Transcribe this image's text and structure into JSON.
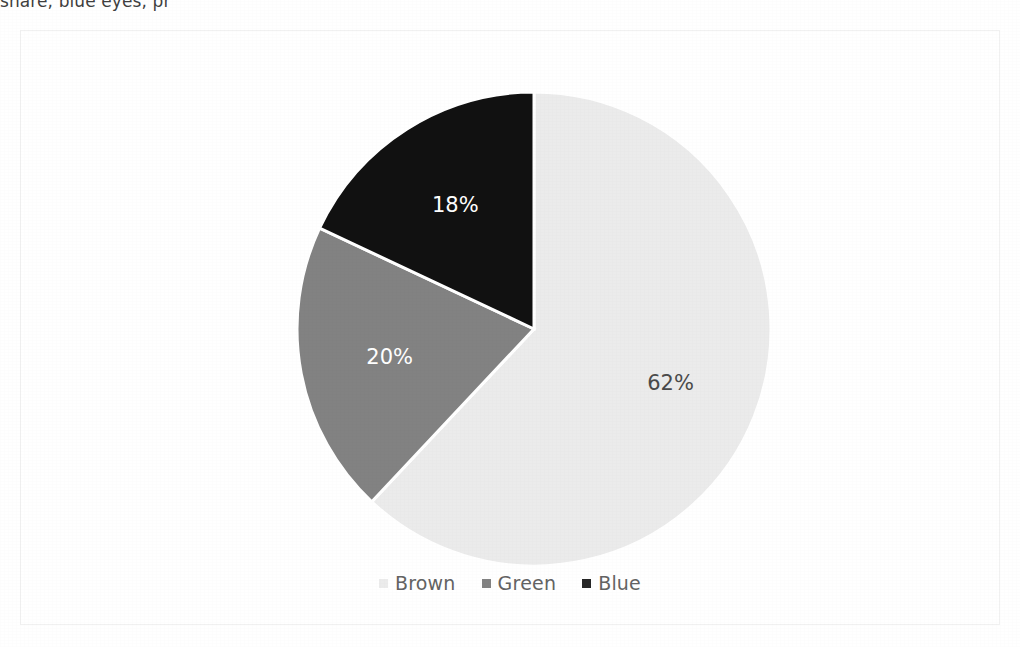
{
  "page": {
    "cropped_header_text": "share, blue eyes, pr",
    "background_color": "#ffffff"
  },
  "chart_frame": {
    "border_color": "#f1f1f1"
  },
  "legend": {
    "position": "bottom",
    "items": [
      {
        "label": "Brown",
        "color": "#ebebeb",
        "swatch_name": "legend-swatch-brown"
      },
      {
        "label": "Green",
        "color": "#828282",
        "swatch_name": "legend-swatch-green"
      },
      {
        "label": "Blue",
        "color": "#262626",
        "swatch_name": "legend-swatch-blue"
      }
    ]
  },
  "chart_data": {
    "type": "pie",
    "title": "",
    "categories": [
      "Brown",
      "Green",
      "Blue"
    ],
    "values": [
      62,
      20,
      18
    ],
    "value_unit": "%",
    "data_labels": [
      "62%",
      "20%",
      "18%"
    ],
    "colors": [
      "#ebebeb",
      "#828282",
      "#111111"
    ],
    "label_colors": [
      "#4a4a4a",
      "#ffffff",
      "#ffffff"
    ],
    "slice_separator_color": "#ffffff",
    "start_angle_deg": 0,
    "direction": "clockwise",
    "legend_position": "bottom",
    "grid": false,
    "center": {
      "x": 513,
      "y": 298,
      "r": 237
    }
  }
}
